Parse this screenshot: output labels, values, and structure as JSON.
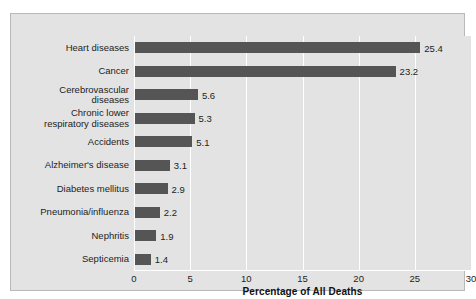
{
  "caption_fragment": "cardiovascular disease.",
  "colors": {
    "bar": "#555555",
    "plot_background": "#e3e3e3",
    "gridline": "#ffffff",
    "frame_border": "#b9b9b9",
    "text": "#1d1d1d"
  },
  "chart_data": {
    "type": "bar",
    "orientation": "horizontal",
    "title": "",
    "xlabel": "Percentage of All Deaths",
    "ylabel": "",
    "xlim": [
      0,
      30
    ],
    "xticks": [
      0,
      5,
      10,
      15,
      20,
      25,
      30
    ],
    "xtick_labels": [
      "0",
      "5",
      "10",
      "15",
      "20",
      "25",
      "30"
    ],
    "grid": "vertical-only",
    "legend": "none",
    "categories": [
      "Heart diseases",
      "Cancer",
      "Cerebrovascular\ndiseases",
      "Chronic lower\nrespiratory diseases",
      "Accidents",
      "Alzheimer's disease",
      "Diabetes mellitus",
      "Pneumonia/influenza",
      "Nephritis",
      "Septicemia"
    ],
    "values": [
      25.4,
      23.2,
      5.6,
      5.3,
      5.1,
      3.1,
      2.9,
      2.2,
      1.9,
      1.4
    ],
    "value_labels": [
      "25.4",
      "23.2",
      "5.6",
      "5.3",
      "5.1",
      "3.1",
      "2.9",
      "2.2",
      "1.9",
      "1.4"
    ]
  }
}
